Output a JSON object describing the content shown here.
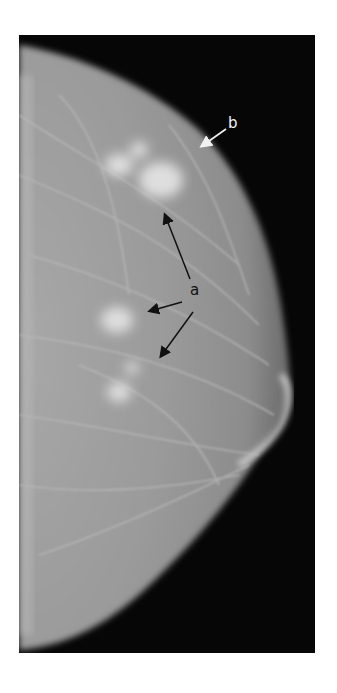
{
  "figure": {
    "type": "mammogram",
    "annotations": [
      {
        "id": "a",
        "label": "a",
        "color": "#111111",
        "arrow_count": 3
      },
      {
        "id": "b",
        "label": "b",
        "color": "#f2f2f2",
        "arrow_count": 1
      }
    ]
  },
  "colors": {
    "background": "#ffffff",
    "film": "#060606",
    "tissue": "#9a9a9a"
  }
}
